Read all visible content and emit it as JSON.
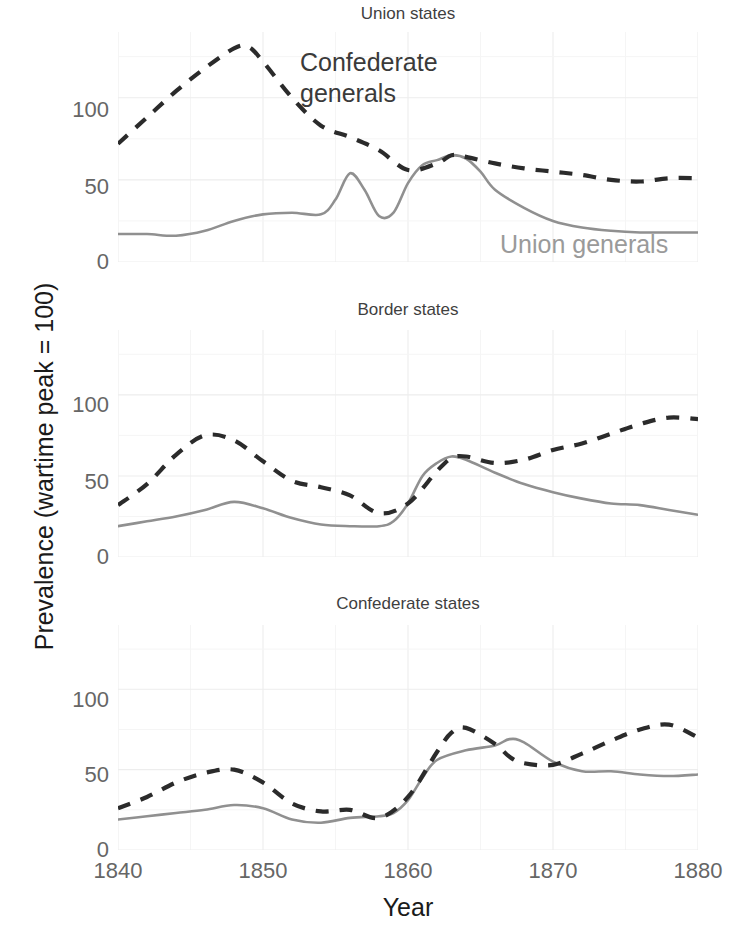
{
  "axes": {
    "ylabel": "Prevalence (wartime peak = 100)",
    "xlabel": "Year",
    "yticks": [
      "0",
      "50",
      "100"
    ],
    "xticks": [
      "1840",
      "1850",
      "1860",
      "1870",
      "1880"
    ]
  },
  "annotations": {
    "confederate_line1": "Confederate",
    "confederate_line2": "generals",
    "union": "Union generals"
  },
  "panels": [
    {
      "title": "Union states"
    },
    {
      "title": "Border states"
    },
    {
      "title": "Confederate states"
    }
  ],
  "colors": {
    "confederate": "#2b2b2b",
    "union": "#909090",
    "grid": "#ededed",
    "text": "#4d4d4d"
  },
  "chart_data": {
    "type": "line",
    "title": "",
    "xlabel": "Year",
    "ylabel": "Prevalence (wartime peak = 100)",
    "xlim": [
      1840,
      1880
    ],
    "ylim": [
      0,
      140
    ],
    "yticks": [
      0,
      50,
      100
    ],
    "xticks": [
      1840,
      1850,
      1860,
      1870,
      1880
    ],
    "grid": true,
    "legend": "inline annotations",
    "facets": [
      {
        "name": "Union states",
        "series": [
          {
            "name": "Confederate generals",
            "style": "dashed",
            "color": "#2b2b2b",
            "x": [
              1840,
              1842,
              1844,
              1846,
              1848,
              1849,
              1850,
              1852,
              1854,
              1856,
              1858,
              1860,
              1862,
              1863,
              1864,
              1866,
              1868,
              1870,
              1872,
              1874,
              1876,
              1878,
              1880
            ],
            "y": [
              72,
              88,
              104,
              118,
              130,
              131,
              122,
              100,
              83,
              76,
              68,
              56,
              60,
              65,
              64,
              60,
              57,
              55,
              53,
              50,
              49,
              51,
              51
            ]
          },
          {
            "name": "Union generals",
            "style": "solid",
            "color": "#909090",
            "x": [
              1840,
              1842,
              1844,
              1846,
              1848,
              1850,
              1852,
              1854,
              1855,
              1856,
              1857,
              1858,
              1859,
              1860,
              1861,
              1862,
              1863,
              1864,
              1865,
              1866,
              1868,
              1870,
              1872,
              1874,
              1876,
              1878,
              1880
            ],
            "y": [
              17,
              17,
              16,
              19,
              25,
              29,
              30,
              29,
              38,
              54,
              44,
              28,
              30,
              48,
              59,
              62,
              65,
              63,
              55,
              44,
              33,
              25,
              21,
              19,
              18,
              18,
              18
            ]
          }
        ]
      },
      {
        "name": "Border states",
        "series": [
          {
            "name": "Confederate generals",
            "style": "dashed",
            "color": "#2b2b2b",
            "x": [
              1840,
              1842,
              1844,
              1846,
              1848,
              1850,
              1852,
              1854,
              1856,
              1858,
              1860,
              1862,
              1863,
              1864,
              1866,
              1868,
              1870,
              1872,
              1874,
              1876,
              1878,
              1880
            ],
            "y": [
              32,
              45,
              63,
              75,
              72,
              59,
              47,
              43,
              38,
              27,
              33,
              53,
              61,
              62,
              58,
              60,
              66,
              70,
              76,
              82,
              86,
              85
            ]
          },
          {
            "name": "Union generals",
            "style": "solid",
            "color": "#909090",
            "x": [
              1840,
              1842,
              1844,
              1846,
              1848,
              1850,
              1852,
              1854,
              1856,
              1858,
              1859,
              1860,
              1861,
              1862,
              1863,
              1864,
              1866,
              1868,
              1870,
              1872,
              1874,
              1876,
              1878,
              1880
            ],
            "y": [
              19,
              22,
              25,
              29,
              34,
              30,
              24,
              20,
              19,
              19,
              22,
              33,
              50,
              58,
              62,
              60,
              52,
              45,
              40,
              36,
              33,
              32,
              29,
              26
            ]
          }
        ]
      },
      {
        "name": "Confederate states",
        "series": [
          {
            "name": "Confederate generals",
            "style": "dashed",
            "color": "#2b2b2b",
            "x": [
              1840,
              1842,
              1844,
              1846,
              1848,
              1850,
              1852,
              1854,
              1856,
              1858,
              1860,
              1862,
              1863,
              1864,
              1866,
              1867,
              1868,
              1870,
              1872,
              1874,
              1876,
              1878,
              1880
            ],
            "y": [
              26,
              33,
              42,
              48,
              50,
              42,
              29,
              24,
              25,
              20,
              33,
              61,
              73,
              76,
              66,
              58,
              54,
              53,
              60,
              68,
              75,
              78,
              70
            ]
          },
          {
            "name": "Union generals",
            "style": "solid",
            "color": "#909090",
            "x": [
              1840,
              1842,
              1844,
              1846,
              1848,
              1850,
              1852,
              1854,
              1856,
              1858,
              1859,
              1860,
              1861,
              1862,
              1864,
              1866,
              1867,
              1868,
              1870,
              1872,
              1874,
              1876,
              1878,
              1880
            ],
            "y": [
              19,
              21,
              23,
              25,
              28,
              26,
              19,
              17,
              20,
              21,
              23,
              31,
              45,
              56,
              62,
              65,
              69,
              67,
              55,
              49,
              49,
              47,
              46,
              47
            ]
          }
        ]
      }
    ]
  }
}
